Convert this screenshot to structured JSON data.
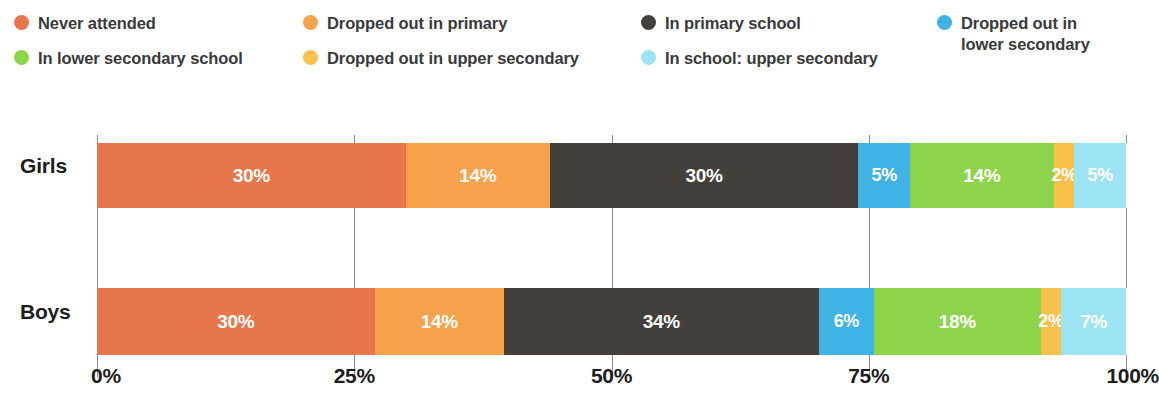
{
  "chart_data": {
    "type": "bar",
    "orientation": "horizontal",
    "stacked": true,
    "normalized_percent": true,
    "title": "",
    "subtitle": "",
    "xlabel": "",
    "ylabel": "",
    "xlim": [
      0,
      100
    ],
    "grid": true,
    "legend_position": "top",
    "categories": [
      "Girls",
      "Boys"
    ],
    "xticks": [
      "0%",
      "25%",
      "50%",
      "75%",
      "100%"
    ],
    "xtick_values": [
      0,
      25,
      50,
      75,
      100
    ],
    "series": [
      {
        "name": "Never attended",
        "color": "#e8764b",
        "values": [
          30,
          30
        ],
        "labels": [
          "30%",
          "30%"
        ]
      },
      {
        "name": "Dropped out in primary",
        "color": "#f9a24c",
        "values": [
          14,
          14
        ],
        "labels": [
          "14%",
          "14%"
        ]
      },
      {
        "name": "In primary school",
        "color": "#443f3b",
        "values": [
          30,
          34
        ],
        "labels": [
          "30%",
          "34%"
        ]
      },
      {
        "name": "Dropped out in lower secondary",
        "color": "#3fb3e3",
        "values": [
          5,
          6
        ],
        "labels": [
          "5%",
          "6%"
        ]
      },
      {
        "name": "In lower secondary school",
        "color": "#8ed44b",
        "values": [
          14,
          18
        ],
        "labels": [
          "14%",
          "18%"
        ]
      },
      {
        "name": "Dropped out in upper secondary",
        "color": "#f9c04c",
        "values": [
          2,
          2
        ],
        "labels": [
          "2%",
          "2%"
        ]
      },
      {
        "name": "In school: upper secondary",
        "color": "#9ce3f4",
        "values": [
          5,
          7
        ],
        "labels": [
          "5%",
          "7%"
        ]
      }
    ]
  },
  "legend": {
    "items": [
      {
        "label": "Never attended",
        "color": "#e8764b"
      },
      {
        "label": "Dropped out in primary",
        "color": "#f9a24c"
      },
      {
        "label": "In primary school",
        "color": "#443f3b"
      },
      {
        "label": "Dropped out in\nlower secondary",
        "color": "#3fb3e3"
      },
      {
        "label": "In lower secondary school",
        "color": "#8ed44b"
      },
      {
        "label": "Dropped out in upper secondary",
        "color": "#f9c04c"
      },
      {
        "label": "In school: upper secondary",
        "color": "#9ce3f4"
      }
    ]
  },
  "axis": {
    "category_labels": [
      "Girls",
      "Boys"
    ],
    "tick_labels": [
      "0%",
      "25%",
      "50%",
      "75%",
      "100%"
    ]
  }
}
